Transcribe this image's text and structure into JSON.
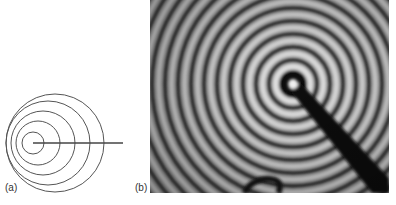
{
  "figure": {
    "panel_a": {
      "label": "(a)",
      "description": "Schematic of circular wavefronts from a moving/offset source with a radial line",
      "source_center": [
        33,
        143
      ],
      "circles": [
        {
          "cx": 33,
          "cy": 143,
          "r": 11
        },
        {
          "cx": 38,
          "cy": 143,
          "r": 22
        },
        {
          "cx": 43,
          "cy": 143,
          "r": 32
        },
        {
          "cx": 48,
          "cy": 143,
          "r": 42
        },
        {
          "cx": 55,
          "cy": 143,
          "r": 49
        }
      ],
      "line": {
        "x1": 33,
        "y1": 143,
        "x2": 123,
        "y2": 143
      },
      "stroke_color": "#555555"
    },
    "panel_b": {
      "label": "(b)",
      "description": "Photograph of concentric ripple tank waves spreading from a point source with a dark probe rod",
      "ring_center": [
        143,
        84
      ],
      "ring_spacing": 13,
      "ring_count": 18,
      "light_color": "#e6e6e6",
      "dark_color": "#3a3a3a"
    }
  }
}
